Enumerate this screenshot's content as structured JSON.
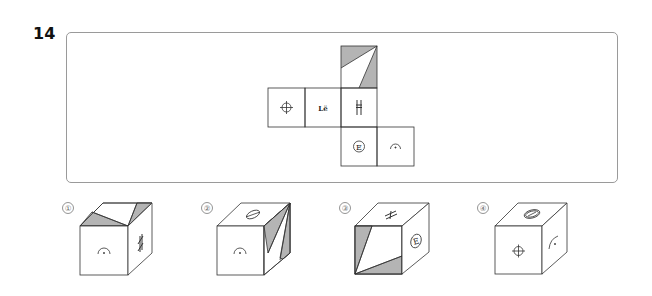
{
  "question": {
    "number": "14"
  },
  "net": {
    "faces": [
      {
        "id": "top",
        "symbol": "shaded-triangles",
        "shade_color": "#b4b4b4"
      },
      {
        "id": "left",
        "symbol": "crosshair-circle"
      },
      {
        "id": "center-left",
        "symbol": "Lё",
        "text": "Lё"
      },
      {
        "id": "center",
        "symbol": "H-bar",
        "text": "H"
      },
      {
        "id": "bottom",
        "symbol": "circled-E",
        "text": "E"
      },
      {
        "id": "bottom-right",
        "symbol": "arc-dot"
      }
    ]
  },
  "options": [
    {
      "label": "①",
      "front": "arc-dot",
      "right": "H-bar",
      "top": "shaded-triangles"
    },
    {
      "label": "②",
      "front": "arc-dot",
      "right": "shaded-triangles",
      "top": "Lё"
    },
    {
      "label": "③",
      "front": "shaded-triangles",
      "right": "circled-E",
      "top": "H-bar"
    },
    {
      "label": "④",
      "front": "crosshair-circle",
      "right": "arc-dot",
      "top": "circled-E"
    }
  ],
  "colors": {
    "line": "#333333",
    "shade": "#b4b4b4",
    "frame": "#9a9a9a"
  }
}
